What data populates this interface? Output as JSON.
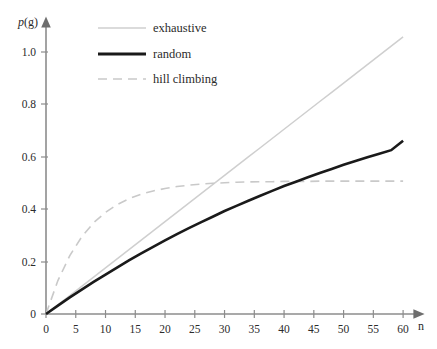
{
  "chart_data": {
    "type": "line",
    "title": "",
    "xlabel": "n",
    "ylabel": "p(g)",
    "xlim": [
      0,
      62
    ],
    "ylim": [
      0,
      1.06
    ],
    "grid": false,
    "legend_position": "top-left-inside",
    "xticks": [
      0,
      5,
      10,
      15,
      20,
      25,
      30,
      35,
      40,
      45,
      50,
      55,
      60
    ],
    "xticklabels": [
      "0",
      "5",
      "10",
      "15",
      "20",
      "25",
      "30",
      "35",
      "40",
      "45",
      "50",
      "55",
      "60"
    ],
    "yticks": [
      0,
      0.2,
      0.4,
      0.6,
      0.8,
      1.0
    ],
    "yticklabels": [
      "0",
      "0.2",
      "0.4",
      "0.6",
      "0.8",
      "1.0"
    ],
    "x": [
      0,
      2,
      4,
      6,
      8,
      10,
      12,
      14,
      16,
      18,
      20,
      22,
      24,
      26,
      28,
      30,
      32,
      34,
      36,
      38,
      40,
      42,
      44,
      46,
      48,
      50,
      52,
      54,
      56,
      58,
      60
    ],
    "series": [
      {
        "name": "exhaustive",
        "color": "#cfcfcf",
        "style": "solid",
        "width": 1.5,
        "values": [
          0,
          0.034,
          0.068,
          0.102,
          0.136,
          0.17,
          0.204,
          0.238,
          0.272,
          0.306,
          0.34,
          0.374,
          0.408,
          0.442,
          0.476,
          0.51,
          0.544,
          0.578,
          0.612,
          0.646,
          0.68,
          0.714,
          0.748,
          0.782,
          0.816,
          0.85,
          0.884,
          0.918,
          0.952,
          0.986,
          1.02
        ]
      },
      {
        "name": "random",
        "color": "#1a1a1a",
        "style": "solid",
        "width": 2.6,
        "values": [
          0,
          0.031,
          0.061,
          0.09,
          0.118,
          0.145,
          0.172,
          0.198,
          0.223,
          0.247,
          0.271,
          0.294,
          0.316,
          0.337,
          0.358,
          0.379,
          0.398,
          0.417,
          0.435,
          0.453,
          0.471,
          0.487,
          0.503,
          0.519,
          0.534,
          0.549,
          0.563,
          0.577,
          0.59,
          0.603,
          0.638
        ]
      },
      {
        "name": "hill climbing",
        "color": "#c9c9c9",
        "style": "dashed",
        "width": 1.6,
        "values": [
          0,
          0.123,
          0.215,
          0.284,
          0.336,
          0.374,
          0.403,
          0.425,
          0.441,
          0.453,
          0.462,
          0.469,
          0.474,
          0.478,
          0.481,
          0.483,
          0.485,
          0.486,
          0.487,
          0.487,
          0.488,
          0.488,
          0.488,
          0.489,
          0.489,
          0.489,
          0.489,
          0.489,
          0.489,
          0.489,
          0.489
        ]
      }
    ],
    "legend": [
      {
        "label": "exhaustive"
      },
      {
        "label": "random"
      },
      {
        "label": "hill climbing"
      }
    ]
  }
}
